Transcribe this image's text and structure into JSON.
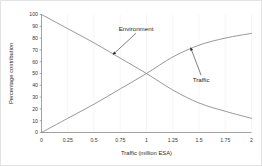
{
  "chart_data": {
    "type": "line",
    "title": "",
    "xlabel": "Traffic (million ESA)",
    "ylabel": "Percentage contribution",
    "xlim": [
      0,
      2
    ],
    "ylim": [
      0,
      100
    ],
    "xticks": [
      "0",
      "0.25",
      "0.5",
      "0.75",
      "1",
      "1.25",
      "1.5",
      "1.75",
      "2"
    ],
    "xtick_values": [
      0,
      0.25,
      0.5,
      0.75,
      1,
      1.25,
      1.5,
      1.75,
      2
    ],
    "yticks": [
      "0",
      "10",
      "20",
      "30",
      "40",
      "50",
      "60",
      "70",
      "80",
      "90",
      "100"
    ],
    "ytick_values": [
      0,
      10,
      20,
      30,
      40,
      50,
      60,
      70,
      80,
      90,
      100
    ],
    "grid": "vertical-only",
    "legend": "none",
    "x": [
      0,
      0.25,
      0.5,
      0.75,
      1,
      1.25,
      1.5,
      1.75,
      2
    ],
    "series": [
      {
        "name": "Environment",
        "color": "#8c8c8c",
        "values": [
          100,
          88,
          76,
          63,
          50,
          36,
          25,
          18,
          12
        ]
      },
      {
        "name": "Traffic",
        "color": "#8c8c8c",
        "values": [
          0,
          12,
          24,
          37,
          50,
          64,
          74,
          80,
          84
        ]
      }
    ],
    "annotations": [
      {
        "label": "Environment",
        "text_x": 0.9,
        "text_y": 86,
        "point_x": 0.68,
        "point_y": 66
      },
      {
        "label": "Traffic",
        "text_x": 1.52,
        "text_y": 43,
        "point_x": 1.42,
        "point_y": 72
      }
    ],
    "colors": {
      "environment": "#8c8c8c",
      "traffic": "#8c8c8c",
      "axis": "#8a8a8a",
      "grid": "#eeeeee",
      "text": "#2b2b2b",
      "background": "#ffffff",
      "border": "#e3e3e3"
    }
  }
}
